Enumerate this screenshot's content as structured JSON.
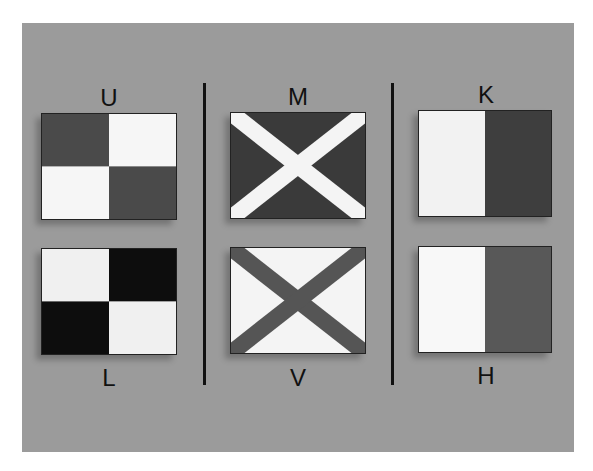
{
  "colors": {
    "background": "#ffffff",
    "panel": "#9b9b9b",
    "dark": "#4a4a4a",
    "black": "#111111",
    "light": "#f4f4f4",
    "divider": "#111111"
  },
  "flags": [
    {
      "letter": "U",
      "pattern": "quartered",
      "label_position": "above",
      "colors": [
        "dark",
        "light",
        "light",
        "dark"
      ]
    },
    {
      "letter": "M",
      "pattern": "saltire",
      "label_position": "above",
      "field": "dark",
      "cross": "light"
    },
    {
      "letter": "K",
      "pattern": "vertical-halves",
      "label_position": "above",
      "colors": [
        "light",
        "dark"
      ]
    },
    {
      "letter": "L",
      "pattern": "quartered",
      "label_position": "below",
      "colors": [
        "light",
        "black",
        "black",
        "light"
      ]
    },
    {
      "letter": "V",
      "pattern": "saltire",
      "label_position": "below",
      "field": "light",
      "cross": "dark"
    },
    {
      "letter": "H",
      "pattern": "vertical-halves",
      "label_position": "below",
      "colors": [
        "light",
        "dark"
      ]
    }
  ]
}
